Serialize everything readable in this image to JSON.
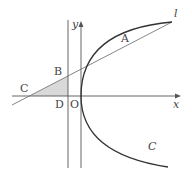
{
  "diagram": {
    "type": "geometry-coordinate-figure",
    "colors": {
      "line": "#555555",
      "curve": "#333333",
      "shade": "#d9d9d9",
      "label": "#444444",
      "background": "#ffffff"
    },
    "axes": {
      "x_label": "x",
      "y_label": "y"
    },
    "curve": {
      "name": "C",
      "label": "C",
      "kind": "parabola (opening right, vertex at O)"
    },
    "tangent_line": {
      "name": "l",
      "label": "l"
    },
    "points": [
      {
        "id": "A",
        "label": "A",
        "desc": "point of tangency on C"
      },
      {
        "id": "B",
        "label": "B",
        "desc": "intersection of l with vertical line"
      },
      {
        "id": "C",
        "label": "C",
        "desc": "intersection of l with x-axis"
      },
      {
        "id": "D",
        "label": "D",
        "desc": "foot of vertical line on x-axis"
      },
      {
        "id": "O",
        "label": "O",
        "desc": "origin"
      }
    ],
    "shaded_region": {
      "label": "triangle BCD",
      "vertices": [
        "B",
        "C",
        "D"
      ]
    }
  }
}
